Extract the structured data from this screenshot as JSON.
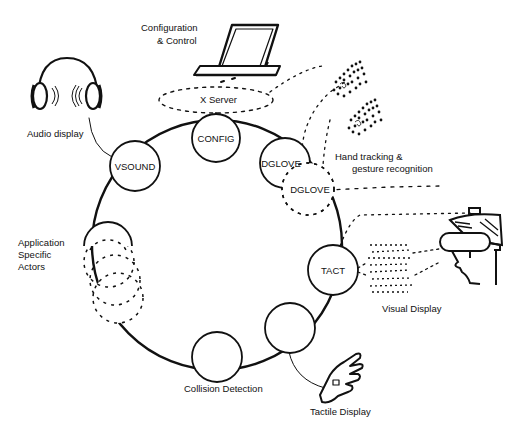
{
  "diagram": {
    "type": "ring-architecture",
    "ring": {
      "cx": 217,
      "cy": 245,
      "r": 125
    },
    "nodes": [
      {
        "id": "config",
        "label": "CONFIG",
        "cx": 216,
        "cy": 138,
        "r": 24,
        "style": "solid"
      },
      {
        "id": "vsound",
        "label": "VSOUND",
        "cx": 135,
        "cy": 166,
        "r": 25,
        "style": "solid"
      },
      {
        "id": "dglove1",
        "label": "DGLOVE",
        "cx": 285,
        "cy": 163,
        "r": 25,
        "style": "solid"
      },
      {
        "id": "dglove2",
        "label": "DGLOVE",
        "cx": 308,
        "cy": 189,
        "r": 26,
        "style": "dashed"
      },
      {
        "id": "viz",
        "label": "VIZ",
        "cx": 333,
        "cy": 270,
        "r": 25,
        "style": "solid"
      },
      {
        "id": "tact",
        "label": "TACT",
        "cx": 290,
        "cy": 328,
        "r": 25,
        "style": "solid"
      },
      {
        "id": "collision",
        "label": "",
        "cx": 217,
        "cy": 357,
        "r": 25,
        "style": "solid"
      },
      {
        "id": "app1",
        "label": "",
        "cx": 107,
        "cy": 243,
        "r": 24,
        "style": "solid-top"
      },
      {
        "id": "app2",
        "label": "",
        "cx": 108,
        "cy": 262,
        "r": 25,
        "style": "dashed"
      },
      {
        "id": "app3",
        "label": "",
        "cx": 115,
        "cy": 280,
        "r": 25,
        "style": "dashed"
      },
      {
        "id": "app4",
        "label": "",
        "cx": 118,
        "cy": 298,
        "r": 25,
        "style": "dashed"
      }
    ],
    "labels": {
      "configuration": "Configuration",
      "control": "& Control",
      "x_server": "X Server",
      "audio_display": "Audio display",
      "hand_tracking": "Hand tracking &",
      "gesture_recognition": "gesture recognition",
      "app_line1": "Application",
      "app_line2": "Specific",
      "app_line3": "Actors",
      "visual_display": "Visual Display",
      "collision_detection": "Collision Detection",
      "tactile_display": "Tactile Display"
    },
    "icons": [
      "laptop-icon",
      "headphones-icon",
      "hand-point-cloud-icon",
      "hmd-head-icon",
      "tactile-glove-icon"
    ],
    "colors": {
      "ink": "#111111",
      "background": "#ffffff"
    }
  }
}
